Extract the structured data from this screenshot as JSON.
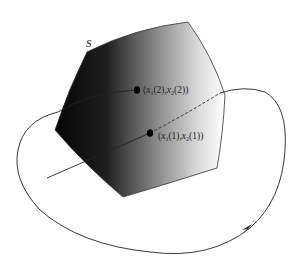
{
  "figure": {
    "surface_label": "S",
    "points": [
      {
        "id": "p2",
        "label": "(x1(2),x2(2))",
        "x": 137,
        "y": 90
      },
      {
        "id": "p1",
        "label": "(x1(1),x2(1))",
        "x": 150,
        "y": 133
      }
    ],
    "label_parts": {
      "p2": {
        "open": "(",
        "x1": "x",
        "sub1": "1",
        "arg1": "(2),",
        "x2": "x",
        "sub2": "2",
        "arg2": "(2))"
      },
      "p1": {
        "open": "(",
        "x1": "x",
        "sub1": "1",
        "arg1": "(1),",
        "x2": "x",
        "sub2": "2",
        "arg2": "(1))"
      }
    },
    "colors": {
      "surface_dark": "#050505",
      "surface_light": "#ffffff",
      "stroke": "#222222"
    }
  }
}
